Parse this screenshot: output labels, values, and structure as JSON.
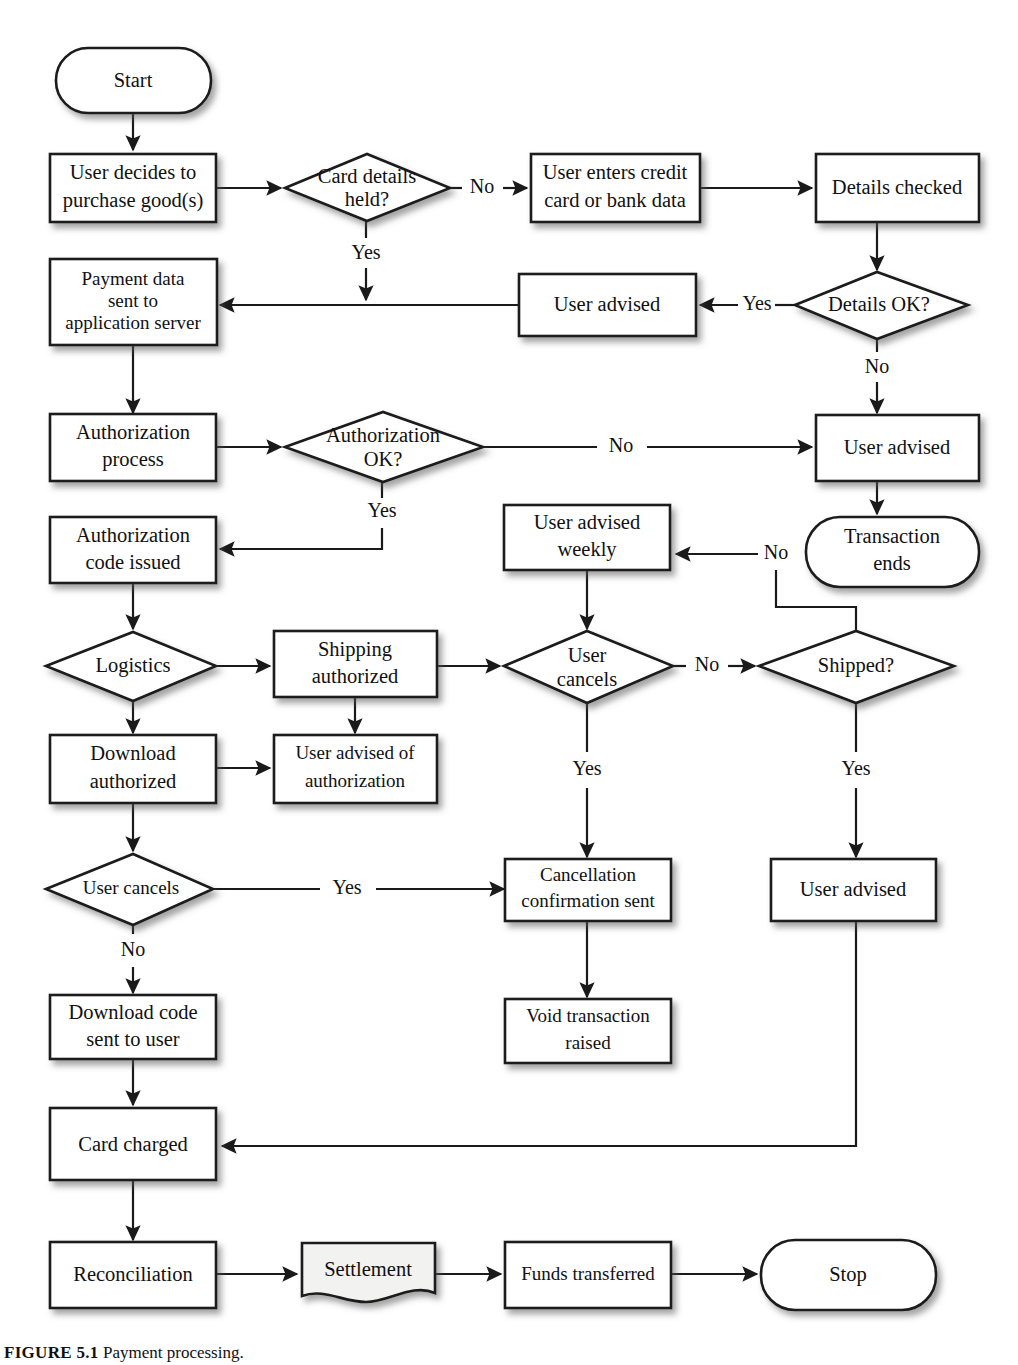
{
  "figure": {
    "caption_label": "FIGURE 5.1",
    "caption_text": "Payment processing.",
    "background_color": "#ffffff",
    "line_color": "#1a1a1a",
    "node_fill": "#ffffff",
    "document_fill": "#f2f2f0"
  },
  "nodes": {
    "start": {
      "label": "Start",
      "shape": "terminator"
    },
    "user_decides": {
      "label_line1": "User decides to",
      "label_line2": "purchase good(s)",
      "shape": "process"
    },
    "card_details_held": {
      "label_line1": "Card details",
      "label_line2": "held?",
      "shape": "decision"
    },
    "user_enters_credit": {
      "label_line1": "User enters credit",
      "label_line2": "card or bank data",
      "shape": "process"
    },
    "details_checked": {
      "label": "Details checked",
      "shape": "process"
    },
    "details_ok": {
      "label": "Details OK?",
      "shape": "decision"
    },
    "user_advised_1": {
      "label": "User advised",
      "shape": "process"
    },
    "payment_data_sent": {
      "label_line1": "Payment data",
      "label_line2": "sent to",
      "label_line3": "application server",
      "shape": "process"
    },
    "authorization_process": {
      "label_line1": "Authorization",
      "label_line2": "process",
      "shape": "process"
    },
    "authorization_ok": {
      "label_line1": "Authorization",
      "label_line2": "OK?",
      "shape": "decision"
    },
    "user_advised_2": {
      "label": "User advised",
      "shape": "process"
    },
    "transaction_ends": {
      "label_line1": "Transaction",
      "label_line2": "ends",
      "shape": "terminator"
    },
    "authorization_code": {
      "label_line1": "Authorization",
      "label_line2": "code issued",
      "shape": "process"
    },
    "user_advised_weekly": {
      "label_line1": "User advised",
      "label_line2": "weekly",
      "shape": "process"
    },
    "logistics": {
      "label": "Logistics",
      "shape": "decision"
    },
    "shipping_authorized": {
      "label_line1": "Shipping",
      "label_line2": "authorized",
      "shape": "process"
    },
    "user_cancels_1": {
      "label_line1": "User",
      "label_line2": "cancels",
      "shape": "decision"
    },
    "shipped": {
      "label": "Shipped?",
      "shape": "decision"
    },
    "download_authorized": {
      "label_line1": "Download",
      "label_line2": "authorized",
      "shape": "process"
    },
    "user_advised_of_auth": {
      "label_line1": "User advised of",
      "label_line2": "authorization",
      "shape": "process"
    },
    "user_cancels_2": {
      "label": "User cancels",
      "shape": "decision"
    },
    "cancellation_confirmation": {
      "label_line1": "Cancellation",
      "label_line2": "confirmation sent",
      "shape": "process"
    },
    "user_advised_3": {
      "label": "User advised",
      "shape": "process"
    },
    "download_code_sent": {
      "label_line1": "Download code",
      "label_line2": "sent to user",
      "shape": "process"
    },
    "void_transaction": {
      "label_line1": "Void transaction",
      "label_line2": "raised",
      "shape": "process"
    },
    "card_charged": {
      "label": "Card charged",
      "shape": "process"
    },
    "reconciliation": {
      "label": "Reconciliation",
      "shape": "process"
    },
    "settlement": {
      "label": "Settlement",
      "shape": "document"
    },
    "funds_transferred": {
      "label": "Funds transferred",
      "shape": "process"
    },
    "stop": {
      "label": "Stop",
      "shape": "terminator"
    }
  },
  "edge_labels": {
    "card_details_no": "No",
    "card_details_yes": "Yes",
    "details_ok_yes": "Yes",
    "details_ok_no": "No",
    "authorization_ok_no": "No",
    "authorization_ok_yes": "Yes",
    "user_cancels_1_no": "No",
    "user_cancels_1_yes": "Yes",
    "shipped_no": "No",
    "shipped_yes": "Yes",
    "user_cancels_2_yes": "Yes",
    "user_cancels_2_no": "No"
  }
}
